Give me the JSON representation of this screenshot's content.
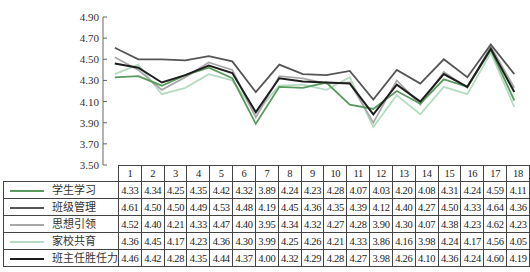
{
  "chart_data": {
    "type": "line",
    "title": "",
    "xlabel": "",
    "ylabel": "",
    "ylim": [
      3.5,
      4.9
    ],
    "yticks": [
      "4.90",
      "4.70",
      "4.50",
      "4.30",
      "4.10",
      "3.90",
      "3.70",
      "3.50"
    ],
    "grid": false,
    "legend_position": "table-bottom-left",
    "categories": [
      "1",
      "2",
      "3",
      "4",
      "5",
      "6",
      "7",
      "8",
      "9",
      "10",
      "11",
      "12",
      "13",
      "14",
      "15",
      "16",
      "17",
      "18"
    ],
    "series": [
      {
        "name": "学生学习",
        "color": "#5a9a5e",
        "values": [
          4.33,
          4.34,
          4.25,
          4.35,
          4.42,
          4.32,
          3.89,
          4.24,
          4.23,
          4.28,
          4.07,
          4.03,
          4.2,
          4.08,
          4.31,
          4.24,
          4.59,
          4.11
        ]
      },
      {
        "name": "班级管理",
        "color": "#555555",
        "values": [
          4.61,
          4.5,
          4.5,
          4.49,
          4.53,
          4.48,
          4.19,
          4.45,
          4.36,
          4.35,
          4.39,
          4.12,
          4.4,
          4.27,
          4.5,
          4.33,
          4.64,
          4.36
        ]
      },
      {
        "name": "思想引领",
        "color": "#a8a8a8",
        "values": [
          4.52,
          4.4,
          4.21,
          4.33,
          4.47,
          4.4,
          3.95,
          4.34,
          4.32,
          4.27,
          4.28,
          3.9,
          4.3,
          4.07,
          4.38,
          4.23,
          4.62,
          4.23
        ]
      },
      {
        "name": "家校共育",
        "color": "#b5dcc0",
        "values": [
          4.36,
          4.45,
          4.17,
          4.23,
          4.36,
          4.3,
          3.99,
          4.25,
          4.26,
          4.21,
          4.33,
          3.86,
          4.16,
          3.98,
          4.24,
          4.17,
          4.56,
          4.05
        ]
      },
      {
        "name": "班主任胜任力",
        "color": "#1e1e1e",
        "values": [
          4.46,
          4.42,
          4.28,
          4.35,
          4.44,
          4.37,
          4.0,
          4.32,
          4.29,
          4.28,
          4.27,
          3.98,
          4.26,
          4.1,
          4.36,
          4.24,
          4.6,
          4.19
        ]
      }
    ]
  }
}
